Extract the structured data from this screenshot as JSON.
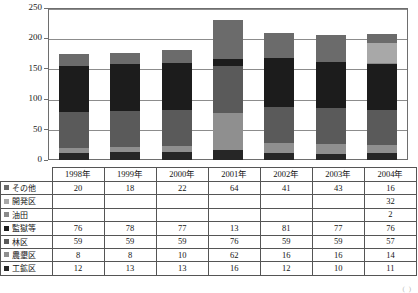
{
  "chart_data": {
    "type": "bar",
    "subtype": "stacked-column",
    "title": "",
    "xlabel": "",
    "ylabel": "",
    "ylim": [
      0,
      250
    ],
    "yticks": [
      0,
      50,
      100,
      150,
      200,
      250
    ],
    "grid": true,
    "legend_position": "row-headers-in-data-table",
    "categories": [
      "1998年",
      "1999年",
      "2000年",
      "2001年",
      "2002年",
      "2003年",
      "2004年"
    ],
    "stack_order_bottom_to_top": [
      "工鉱区",
      "農墾区",
      "林区",
      "監獄等",
      "油田",
      "開発区",
      "その他"
    ],
    "series": [
      {
        "name": "その他",
        "color": "#6b6b6b",
        "values": [
          20,
          18,
          22,
          64,
          41,
          43,
          16
        ]
      },
      {
        "name": "開発区",
        "color": "#a8a8a8",
        "values": [
          null,
          null,
          null,
          null,
          null,
          null,
          32
        ]
      },
      {
        "name": "油田",
        "color": "#8a8a8a",
        "values": [
          null,
          null,
          null,
          null,
          null,
          null,
          2
        ]
      },
      {
        "name": "監獄等",
        "color": "#1c1c1c",
        "values": [
          76,
          78,
          77,
          13,
          81,
          77,
          76
        ]
      },
      {
        "name": "林区",
        "color": "#5a5a5a",
        "values": [
          59,
          59,
          59,
          76,
          59,
          59,
          57
        ]
      },
      {
        "name": "農墾区",
        "color": "#8f8f8f",
        "values": [
          8,
          8,
          10,
          62,
          16,
          16,
          14
        ]
      },
      {
        "name": "工鉱区",
        "color": "#262626",
        "values": [
          12,
          13,
          13,
          16,
          12,
          10,
          11
        ]
      }
    ],
    "totals": [
      175,
      176,
      181,
      231,
      209,
      205,
      208
    ]
  },
  "table": {
    "row_header_blank": "",
    "columns": [
      "1998年",
      "1999年",
      "2000年",
      "2001年",
      "2002年",
      "2003年",
      "2004年"
    ],
    "rows": [
      {
        "label": "その他",
        "swatch": "#6b6b6b",
        "cells": [
          "20",
          "18",
          "22",
          "64",
          "41",
          "43",
          "16"
        ]
      },
      {
        "label": "開発区",
        "swatch": "#a8a8a8",
        "cells": [
          "",
          "",
          "",
          "",
          "",
          "",
          "32"
        ]
      },
      {
        "label": "油田",
        "swatch": "#8a8a8a",
        "cells": [
          "",
          "",
          "",
          "",
          "",
          "",
          "2"
        ]
      },
      {
        "label": "監獄等",
        "swatch": "#1c1c1c",
        "cells": [
          "76",
          "78",
          "77",
          "13",
          "81",
          "77",
          "76"
        ]
      },
      {
        "label": "林区",
        "swatch": "#5a5a5a",
        "cells": [
          "59",
          "59",
          "59",
          "76",
          "59",
          "59",
          "57"
        ]
      },
      {
        "label": "農墾区",
        "swatch": "#8f8f8f",
        "cells": [
          "8",
          "8",
          "10",
          "62",
          "16",
          "16",
          "14"
        ]
      },
      {
        "label": "工鉱区",
        "swatch": "#262626",
        "cells": [
          "12",
          "13",
          "13",
          "16",
          "12",
          "10",
          "11"
        ]
      }
    ]
  },
  "axis": {
    "y_labels": [
      "250",
      "200",
      "150",
      "100",
      "50",
      "0"
    ]
  },
  "footnote": "( )"
}
